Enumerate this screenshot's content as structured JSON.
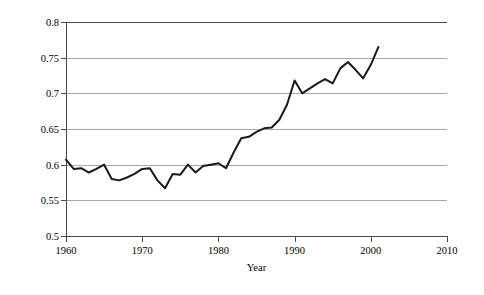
{
  "chart_data": {
    "type": "line",
    "title": "",
    "xlabel": "Year",
    "ylabel": "Female-Male Earnings Ratio",
    "xlim": [
      1960,
      2010
    ],
    "ylim": [
      0.5,
      0.8
    ],
    "xticks": [
      1960,
      1970,
      1980,
      1990,
      2000,
      2010
    ],
    "yticks": [
      0.5,
      0.55,
      0.6,
      0.65,
      0.7,
      0.75,
      0.8
    ],
    "xtick_labels": [
      "1960",
      "1970",
      "1980",
      "1990",
      "2000",
      "2010"
    ],
    "ytick_labels": [
      "0.5",
      "0.55",
      "0.6",
      "0.65",
      "0.7",
      "0.75",
      "0.8"
    ],
    "grid": "horizontal",
    "legend": "none",
    "line_color": "#1a1a1a",
    "gridline_color": "#a8a8a8",
    "axis_color": "#4a4a4a",
    "background_color": "#ffffff",
    "x": [
      1960,
      1961,
      1962,
      1963,
      1964,
      1965,
      1966,
      1967,
      1968,
      1969,
      1970,
      1971,
      1972,
      1973,
      1974,
      1975,
      1976,
      1977,
      1978,
      1979,
      1980,
      1981,
      1982,
      1983,
      1984,
      1985,
      1986,
      1987,
      1988,
      1989,
      1990,
      1991,
      1992,
      1993,
      1994,
      1995,
      1996,
      1997,
      1998,
      1999,
      2000,
      2001
    ],
    "values": [
      0.607,
      0.594,
      0.595,
      0.589,
      0.594,
      0.6,
      0.58,
      0.578,
      0.582,
      0.587,
      0.594,
      0.595,
      0.578,
      0.567,
      0.587,
      0.586,
      0.6,
      0.589,
      0.598,
      0.6,
      0.602,
      0.595,
      0.617,
      0.637,
      0.639,
      0.646,
      0.651,
      0.652,
      0.663,
      0.684,
      0.718,
      0.7,
      0.707,
      0.714,
      0.72,
      0.714,
      0.735,
      0.744,
      0.733,
      0.721,
      0.74,
      0.765
    ],
    "series": [
      {
        "name": "Female-Male Earnings Ratio",
        "values": [
          0.607,
          0.594,
          0.595,
          0.589,
          0.594,
          0.6,
          0.58,
          0.578,
          0.582,
          0.587,
          0.594,
          0.595,
          0.578,
          0.567,
          0.587,
          0.586,
          0.6,
          0.589,
          0.598,
          0.6,
          0.602,
          0.595,
          0.617,
          0.637,
          0.639,
          0.646,
          0.651,
          0.652,
          0.663,
          0.684,
          0.718,
          0.7,
          0.707,
          0.714,
          0.72,
          0.714,
          0.735,
          0.744,
          0.733,
          0.721,
          0.74,
          0.765
        ]
      }
    ],
    "annotations": []
  }
}
